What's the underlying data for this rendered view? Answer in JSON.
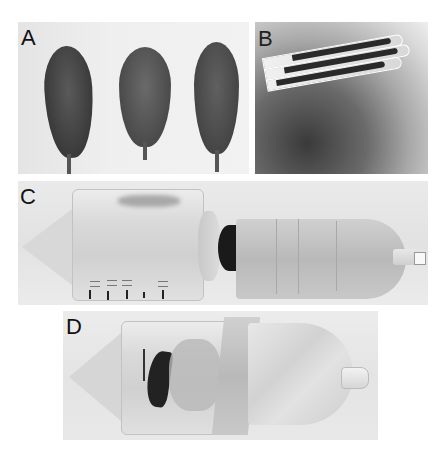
{
  "figure": {
    "panels": [
      {
        "id": "A",
        "label": "A",
        "description": "Three leaves laid flat on a light background"
      },
      {
        "id": "B",
        "label": "B",
        "description": "A folded leaf held between fingers"
      },
      {
        "id": "C",
        "label": "C",
        "description": "Tube with graduated scale next to a taped leaf-filled tube"
      },
      {
        "id": "D",
        "label": "D",
        "description": "Tube containing a folded leaf, wrapped with tape"
      }
    ]
  }
}
